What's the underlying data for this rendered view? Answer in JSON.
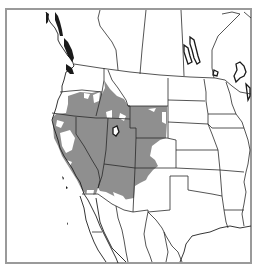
{
  "map": {
    "title": "",
    "description": "Distribution range map of western North America",
    "region": "Western North America",
    "range_color": "#8f8f8f",
    "frame_color": "#9a9a9a",
    "background": "#ffffff",
    "border_color": "#2a2a2a",
    "range_regions": [
      "Oregon (eastern)",
      "Idaho",
      "Wyoming",
      "California",
      "Nevada",
      "Utah",
      "Colorado (western)",
      "Arizona",
      "New Mexico (northwestern)"
    ],
    "labels": []
  }
}
